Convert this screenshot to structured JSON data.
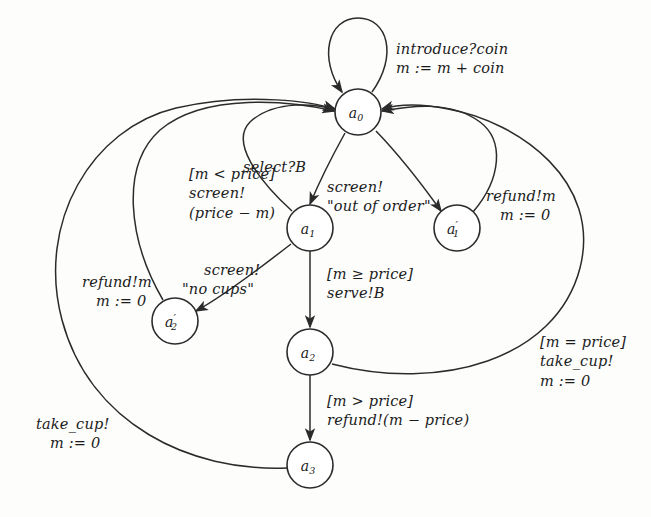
{
  "figure": {
    "type": "state-machine-diagram",
    "background_color": "#fdfdfc",
    "ink_color": "#2b2b2b"
  },
  "states": [
    {
      "id": "a0",
      "label": "a",
      "sub": "0",
      "prime": "",
      "cx": 358,
      "cy": 112,
      "r": 23
    },
    {
      "id": "a1",
      "label": "a",
      "sub": "1",
      "prime": "",
      "cx": 310,
      "cy": 228,
      "r": 23
    },
    {
      "id": "a1p",
      "label": "a",
      "sub": "1",
      "prime": "′",
      "cx": 457,
      "cy": 228,
      "r": 23
    },
    {
      "id": "a2p",
      "label": "a",
      "sub": "2",
      "prime": "′",
      "cx": 175,
      "cy": 321,
      "r": 23
    },
    {
      "id": "a2",
      "label": "a",
      "sub": "2",
      "prime": "",
      "cx": 310,
      "cy": 352,
      "r": 23
    },
    {
      "id": "a3",
      "label": "a",
      "sub": "3",
      "prime": "",
      "cx": 310,
      "cy": 465,
      "r": 23
    }
  ],
  "transitions": [
    {
      "id": "t-introduce",
      "from": "a0",
      "to": "a0",
      "kind": "self-loop",
      "lines": [
        "introduce?coin",
        "m := m + coin"
      ],
      "label_x": 396,
      "label_y": 40
    },
    {
      "id": "t-select",
      "from": "a0",
      "to": "a1",
      "kind": "arc",
      "lines": [
        "select?B"
      ],
      "label_x": 243,
      "label_y": 158
    },
    {
      "id": "t-out-of-order",
      "from": "a0",
      "to": "a1p",
      "kind": "arc",
      "lines": [
        "screen!",
        "\"out of order\""
      ],
      "label_x": 327,
      "label_y": 178
    },
    {
      "id": "t-refund-a1p",
      "from": "a1p",
      "to": "a0",
      "kind": "arc",
      "lines": [
        "refund!m",
        "m := 0"
      ],
      "label_x": 486,
      "label_y": 187
    },
    {
      "id": "t-m-less-price",
      "from": "a1",
      "to": "a0",
      "kind": "arc",
      "lines": [
        "[m < price]",
        "screen!",
        "(price − m)"
      ],
      "label_x": 189,
      "label_y": 165
    },
    {
      "id": "t-no-cups",
      "from": "a1",
      "to": "a2p",
      "kind": "arc",
      "lines": [
        "screen!",
        "\"no cups\""
      ],
      "label_x": 182,
      "label_y": 261
    },
    {
      "id": "t-refund-a2p",
      "from": "a2p",
      "to": "a0",
      "kind": "arc",
      "lines": [
        "refund!m",
        "m := 0"
      ],
      "label_x": 82,
      "label_y": 273
    },
    {
      "id": "t-serve",
      "from": "a1",
      "to": "a2",
      "kind": "line",
      "lines": [
        "[m ≥ price]",
        "serve!B"
      ],
      "label_x": 327,
      "label_y": 265
    },
    {
      "id": "t-refund-diff",
      "from": "a2",
      "to": "a3",
      "kind": "line",
      "lines": [
        "[m > price]",
        "refund!(m − price)"
      ],
      "label_x": 327,
      "label_y": 392
    },
    {
      "id": "t-take-cup-equal",
      "from": "a2",
      "to": "a0",
      "kind": "arc",
      "lines": [
        "[m = price]",
        "take_cup!",
        "m := 0"
      ],
      "label_x": 540,
      "label_y": 333
    },
    {
      "id": "t-take-cup-a3",
      "from": "a3",
      "to": "a0",
      "kind": "arc",
      "lines": [
        "take_cup!",
        "m := 0"
      ],
      "label_x": 36,
      "label_y": 415
    }
  ]
}
